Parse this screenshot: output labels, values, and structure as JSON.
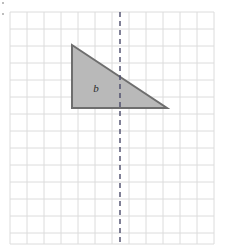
{
  "figure": {
    "background_color": "#ffffff"
  },
  "grid": {
    "name": "square-grid",
    "left": 10,
    "top": 12,
    "right": 214,
    "bottom": 244,
    "cell_size": 17,
    "columns": 12,
    "rows": 13.6,
    "line_color": "#dcdcdc",
    "line_width": 1
  },
  "shape": {
    "name": "triangle-b",
    "type": "right-triangle",
    "label": "b",
    "fill_color": "#b9b9b9",
    "stroke_color": "#6e6e6e",
    "stroke_width": 2,
    "points": "72,45 72,108 167,108",
    "vertices": [
      {
        "name": "apex-top-left",
        "x": 72,
        "y": 45
      },
      {
        "name": "right-angle-bottom-left",
        "x": 72,
        "y": 108
      },
      {
        "name": "bottom-right",
        "x": 167,
        "y": 108
      }
    ],
    "label_position": {
      "x": 96,
      "y": 92
    }
  },
  "mirror_line": {
    "name": "dashed-vertical-line",
    "x": 120,
    "y_start": 12,
    "y_end": 244,
    "color": "#4a4a6a",
    "width": 1.4,
    "dash_pattern": "5,4"
  },
  "marks": {
    "top_left_tick": "corner-tick",
    "left_upper_tick": "corner-tick"
  }
}
